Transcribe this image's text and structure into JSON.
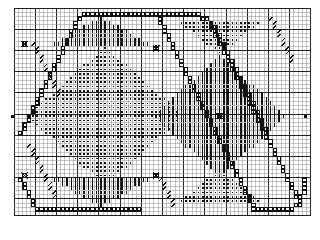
{
  "document": {
    "title": "Cross-Stitch Pattern Chart",
    "kind": "needlework-grid-chart"
  },
  "colors": {
    "background": "#ffffff",
    "grid_minor": "#8c8c8c",
    "grid_major": "#222222",
    "symbol_ink": "#111111",
    "symbol_light": "#555555"
  },
  "grid": {
    "origin_x": 14,
    "origin_y": 8,
    "cell": 4.24,
    "cols": 70,
    "rows": 49,
    "major_every": 5,
    "minor_width": 0.5,
    "major_width": 1.0,
    "border": true
  },
  "legend_symbols": [
    {
      "key": "open-square",
      "name": "open-square-symbol",
      "label": "open square (backstitch chain)"
    },
    {
      "key": "dot",
      "name": "dot-symbol",
      "label": "small dot fill"
    },
    {
      "key": "vbar",
      "name": "vertical-bar-symbol",
      "label": "vertical bar fill"
    },
    {
      "key": "slash",
      "name": "slash-symbol",
      "label": "diagonal slash"
    },
    {
      "key": "cross",
      "name": "cross-marker-symbol",
      "label": "cross marker"
    },
    {
      "key": "edge-tick",
      "name": "edge-tick-symbol",
      "label": "edge registration tick"
    }
  ],
  "chart_data": {
    "type": "heatmap",
    "xlabel": "",
    "ylabel": "",
    "grid": true,
    "legend": "none",
    "xlim": [
      0,
      70
    ],
    "ylim": [
      0,
      49
    ],
    "categories": [],
    "values": [],
    "note": "Symmetric diamond/ogee repeat motif charted on a 70x49 stitch grid; cells carry one of six stitch symbols.",
    "symbol_regions": [
      {
        "symbol": "open-square",
        "name": "upper-left-arch-chain",
        "kind": "polyline",
        "points": [
          [
            1,
            29
          ],
          [
            2,
            27
          ],
          [
            3,
            25
          ],
          [
            4,
            23
          ],
          [
            5,
            21
          ],
          [
            6,
            19
          ],
          [
            7,
            17
          ],
          [
            8,
            15
          ],
          [
            9,
            13
          ],
          [
            10,
            11
          ],
          [
            11,
            9
          ],
          [
            12,
            7
          ],
          [
            13,
            5
          ],
          [
            14,
            3
          ],
          [
            15,
            2
          ],
          [
            16,
            1
          ],
          [
            18,
            1
          ],
          [
            20,
            1
          ],
          [
            22,
            1
          ],
          [
            24,
            1
          ],
          [
            26,
            1
          ],
          [
            28,
            1
          ],
          [
            30,
            1
          ],
          [
            32,
            1
          ]
        ]
      },
      {
        "symbol": "open-square",
        "name": "upper-right-arch-chain",
        "kind": "polyline",
        "points": [
          [
            33,
            1
          ],
          [
            35,
            1
          ],
          [
            37,
            1
          ],
          [
            39,
            1
          ],
          [
            41,
            1
          ],
          [
            43,
            1
          ],
          [
            45,
            2
          ],
          [
            46,
            3
          ],
          [
            47,
            5
          ],
          [
            48,
            7
          ],
          [
            49,
            9
          ],
          [
            50,
            11
          ],
          [
            51,
            13
          ],
          [
            52,
            15
          ],
          [
            53,
            17
          ],
          [
            54,
            19
          ],
          [
            55,
            21
          ],
          [
            56,
            23
          ],
          [
            57,
            25
          ],
          [
            58,
            27
          ],
          [
            59,
            29
          ]
        ]
      },
      {
        "symbol": "open-square",
        "name": "central-descending-diagonal",
        "kind": "polyline",
        "points": [
          [
            45,
            2
          ],
          [
            46,
            4
          ],
          [
            47,
            6
          ],
          [
            48,
            8
          ],
          [
            49,
            10
          ],
          [
            50,
            12
          ],
          [
            51,
            14
          ],
          [
            52,
            16
          ],
          [
            53,
            18
          ],
          [
            54,
            20
          ],
          [
            55,
            22
          ],
          [
            56,
            24
          ],
          [
            57,
            26
          ],
          [
            58,
            28
          ],
          [
            59,
            30
          ],
          [
            60,
            32
          ],
          [
            61,
            34
          ],
          [
            62,
            36
          ],
          [
            63,
            38
          ],
          [
            64,
            40
          ],
          [
            65,
            42
          ],
          [
            66,
            44
          ],
          [
            67,
            46
          ]
        ]
      },
      {
        "symbol": "open-square",
        "name": "mid-right-descending-diagonal",
        "kind": "polyline",
        "points": [
          [
            33,
            1
          ],
          [
            34,
            3
          ],
          [
            35,
            5
          ],
          [
            36,
            7
          ],
          [
            37,
            9
          ],
          [
            38,
            11
          ],
          [
            39,
            13
          ],
          [
            40,
            15
          ],
          [
            41,
            17
          ],
          [
            42,
            19
          ],
          [
            43,
            21
          ],
          [
            44,
            23
          ],
          [
            45,
            25
          ],
          [
            46,
            27
          ],
          [
            47,
            29
          ],
          [
            48,
            31
          ],
          [
            49,
            33
          ],
          [
            50,
            35
          ],
          [
            51,
            37
          ],
          [
            52,
            39
          ],
          [
            53,
            41
          ],
          [
            54,
            43
          ],
          [
            55,
            45
          ],
          [
            56,
            47
          ]
        ]
      },
      {
        "symbol": "open-square",
        "name": "lower-left-arch-chain",
        "kind": "polyline",
        "points": [
          [
            1,
            40
          ],
          [
            2,
            42
          ],
          [
            3,
            44
          ],
          [
            4,
            46
          ],
          [
            5,
            47
          ],
          [
            7,
            47
          ],
          [
            9,
            47
          ],
          [
            11,
            47
          ],
          [
            13,
            47
          ],
          [
            15,
            47
          ],
          [
            17,
            47
          ],
          [
            19,
            47
          ],
          [
            21,
            47
          ],
          [
            23,
            47
          ],
          [
            25,
            47
          ],
          [
            27,
            47
          ],
          [
            29,
            47
          ]
        ]
      },
      {
        "symbol": "open-square",
        "name": "lower-right-arch-chain",
        "kind": "polyline",
        "points": [
          [
            56,
            47
          ],
          [
            58,
            47
          ],
          [
            60,
            47
          ],
          [
            62,
            47
          ],
          [
            64,
            47
          ],
          [
            66,
            46
          ],
          [
            67,
            44
          ],
          [
            68,
            42
          ],
          [
            68,
            40
          ]
        ]
      },
      {
        "symbol": "dot",
        "name": "left-large-dot-diamond",
        "kind": "diamond",
        "center": [
          21,
          25
        ],
        "rx": 18,
        "ry": 16
      },
      {
        "symbol": "dot",
        "name": "upper-right-small-dot-triangle",
        "kind": "triangle-down",
        "apex": [
          48,
          10
        ],
        "half_width": 9,
        "height": 8
      },
      {
        "symbol": "dot",
        "name": "lower-right-small-dot-triangle",
        "kind": "triangle-up",
        "apex": [
          48,
          38
        ],
        "half_width": 9,
        "height": 8
      },
      {
        "symbol": "vbar",
        "name": "right-large-bar-diamond",
        "kind": "diamond",
        "center": [
          48,
          25
        ],
        "rx": 15,
        "ry": 14
      },
      {
        "symbol": "vbar",
        "name": "top-center-bar-fan",
        "kind": "fan-top",
        "center": [
          20,
          2
        ],
        "half_width": 11,
        "height": 7
      },
      {
        "symbol": "vbar",
        "name": "bottom-center-bar-fan",
        "kind": "fan-bottom",
        "center": [
          20,
          46
        ],
        "half_width": 11,
        "height": 7
      },
      {
        "symbol": "slash",
        "name": "upper-left-slash-run",
        "kind": "polyline",
        "points": [
          [
            3,
            32
          ],
          [
            4,
            34
          ],
          [
            5,
            36
          ],
          [
            6,
            38
          ],
          [
            7,
            40
          ],
          [
            8,
            42
          ],
          [
            9,
            44
          ]
        ]
      },
      {
        "symbol": "slash",
        "name": "upper-left-slash-run-b",
        "kind": "polyline",
        "points": [
          [
            4,
            8
          ],
          [
            5,
            10
          ],
          [
            6,
            12
          ],
          [
            7,
            14
          ],
          [
            8,
            16
          ],
          [
            9,
            18
          ],
          [
            10,
            20
          ]
        ]
      },
      {
        "symbol": "slash",
        "name": "right-upper-slash-run",
        "kind": "polyline",
        "points": [
          [
            60,
            2
          ],
          [
            61,
            4
          ],
          [
            62,
            6
          ],
          [
            63,
            8
          ],
          [
            64,
            10
          ],
          [
            65,
            12
          ]
        ]
      },
      {
        "symbol": "slash",
        "name": "lower-center-slash-run",
        "kind": "polyline",
        "points": [
          [
            34,
            40
          ],
          [
            35,
            42
          ],
          [
            36,
            44
          ],
          [
            37,
            46
          ]
        ]
      },
      {
        "symbol": "cross",
        "name": "cross-marker-center-right",
        "kind": "point",
        "point": [
          48,
          25
        ]
      },
      {
        "symbol": "cross",
        "name": "cross-marker-upper-mid",
        "kind": "point",
        "point": [
          33,
          9
        ]
      },
      {
        "symbol": "cross",
        "name": "cross-marker-lower-left",
        "kind": "point",
        "point": [
          2,
          39
        ]
      },
      {
        "symbol": "cross",
        "name": "cross-marker-lower-mid",
        "kind": "point",
        "point": [
          33,
          39
        ]
      },
      {
        "symbol": "cross",
        "name": "cross-marker-upper-left",
        "kind": "point",
        "point": [
          2,
          8
        ]
      },
      {
        "symbol": "edge-tick",
        "name": "left-edge-center-tick",
        "kind": "point",
        "point": [
          0,
          25
        ]
      },
      {
        "symbol": "edge-tick",
        "name": "right-edge-center-tick",
        "kind": "point",
        "point": [
          69,
          25
        ]
      }
    ]
  }
}
